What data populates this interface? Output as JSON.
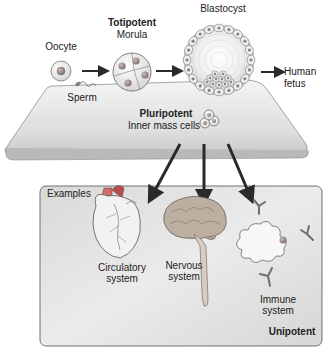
{
  "diagram": {
    "stages": {
      "oocyte": "Oocyte",
      "sperm": "Sperm",
      "totipotent": "Totipotent",
      "morula": "Morula",
      "blastocyst": "Blastocyst",
      "human_fetus_line1": "Human",
      "human_fetus_line2": "fetus",
      "pluripotent": "Pluripotent",
      "inner_mass_cells": "Inner mass cells"
    },
    "examples_box": {
      "label": "Examples",
      "potency": "Unipotent",
      "items": [
        {
          "line1": "Circulatory",
          "line2": "system"
        },
        {
          "line1": "Nervous",
          "line2": "system"
        },
        {
          "line1": "Immune",
          "line2": "system"
        }
      ]
    },
    "colors": {
      "platform_top": "#e8e8e8",
      "platform_edge": "#9a9a9a",
      "box_fill": "#dcdcdc",
      "arrow": "#2a2a2a",
      "heart_red": "#b84a4a",
      "brain": "#b9a99d",
      "cell_nucleus": "#9c8a86"
    }
  }
}
